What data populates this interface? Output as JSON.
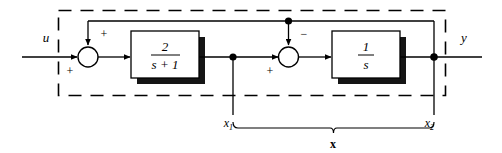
{
  "diagram": {
    "colors": {
      "line": "#000000",
      "shadow": "#111111",
      "background": "#ffffff",
      "boundary": "#000000"
    },
    "signals": {
      "input_label": "u",
      "output_label": "y",
      "state1_label": "x",
      "state1_sub": "1",
      "state2_label": "x",
      "state2_sub": "2",
      "state_vector_label": "x"
    },
    "blocks": [
      {
        "id": "block-1",
        "numerator": "2",
        "denominator": "s + 1",
        "transfer_function": "2/(s+1)"
      },
      {
        "id": "block-2",
        "numerator": "1",
        "denominator": "s",
        "transfer_function": "1/s"
      }
    ],
    "summers": [
      {
        "id": "summer-1",
        "sign_top": "+",
        "sign_left": "+"
      },
      {
        "id": "summer-2",
        "sign_top": "−",
        "sign_left": "+"
      }
    ],
    "nodes": [
      {
        "id": "node-x1",
        "label": "x1"
      },
      {
        "id": "node-x2",
        "label": "x2"
      },
      {
        "id": "node-feedback-tap",
        "label": "inner feedback tap"
      }
    ],
    "annotations": {
      "boundary_style": "dashed",
      "brace_label": "x"
    }
  }
}
